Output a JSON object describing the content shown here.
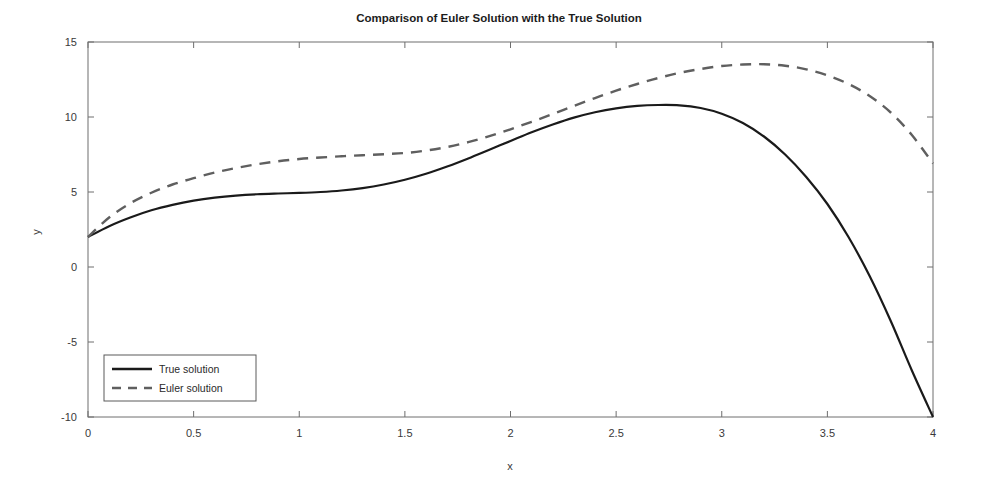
{
  "chart_data": {
    "type": "line",
    "title": "Comparison of Euler Solution with the True Solution",
    "xlabel": "x",
    "ylabel": "y",
    "xlim": [
      0,
      4
    ],
    "ylim": [
      -10,
      15
    ],
    "xticks": [
      0,
      0.5,
      1,
      1.5,
      2,
      2.5,
      3,
      3.5,
      4
    ],
    "xticklabels": [
      "0",
      "0.5",
      "1",
      "1.5",
      "2",
      "2.5",
      "3",
      "3.5",
      "4"
    ],
    "yticks": [
      -10,
      -5,
      0,
      5,
      10,
      15
    ],
    "yticklabels": [
      "-10",
      "-5",
      "0",
      "5",
      "10",
      "15"
    ],
    "grid": false,
    "legend_position": "lower left",
    "x": [
      0,
      0.1,
      0.2,
      0.3,
      0.4,
      0.5,
      0.6,
      0.7,
      0.8,
      0.9,
      1.0,
      1.1,
      1.2,
      1.3,
      1.4,
      1.5,
      1.6,
      1.7,
      1.8,
      1.9,
      2.0,
      2.1,
      2.2,
      2.3,
      2.4,
      2.5,
      2.6,
      2.7,
      2.8,
      2.9,
      3.0,
      3.1,
      3.2,
      3.3,
      3.4,
      3.5,
      3.6,
      3.7,
      3.8,
      3.9,
      4.0
    ],
    "series": [
      {
        "name": "True solution",
        "style": "solid",
        "color": "#1a1a1a",
        "values": [
          2.0,
          2.72,
          3.3,
          3.78,
          4.14,
          4.42,
          4.62,
          4.76,
          4.85,
          4.9,
          4.94,
          5.0,
          5.1,
          5.26,
          5.5,
          5.82,
          6.22,
          6.7,
          7.24,
          7.82,
          8.4,
          8.98,
          9.5,
          9.96,
          10.32,
          10.58,
          10.74,
          10.8,
          10.78,
          10.6,
          10.22,
          9.6,
          8.7,
          7.5,
          6.0,
          4.2,
          2.0,
          -0.6,
          -3.6,
          -6.9,
          -10.0
        ]
      },
      {
        "name": "Euler solution",
        "style": "dashed",
        "color": "#5f5f5f",
        "values": [
          2.0,
          3.3,
          4.25,
          4.95,
          5.5,
          5.92,
          6.3,
          6.6,
          6.85,
          7.05,
          7.2,
          7.3,
          7.38,
          7.45,
          7.52,
          7.6,
          7.76,
          8.0,
          8.32,
          8.72,
          9.18,
          9.68,
          10.2,
          10.74,
          11.26,
          11.76,
          12.2,
          12.6,
          12.94,
          13.2,
          13.4,
          13.5,
          13.52,
          13.42,
          13.18,
          12.78,
          12.2,
          11.4,
          10.3,
          8.8,
          6.9
        ]
      }
    ]
  },
  "legend": {
    "entries": [
      {
        "label": "True solution"
      },
      {
        "label": "Euler solution"
      }
    ]
  }
}
